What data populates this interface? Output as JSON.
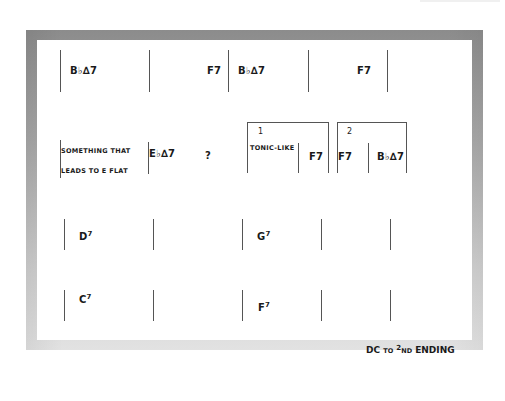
{
  "chart": {
    "rows": [
      {
        "row": 1,
        "measures": [
          {
            "chords": [
              "B♭∆7"
            ]
          },
          {
            "chords": [
              "F7"
            ]
          },
          {
            "chords": [
              "B♭∆7"
            ]
          },
          {
            "chords": [
              "F7"
            ]
          }
        ]
      },
      {
        "row": 2,
        "annotation_line1": "SOMETHING THAT",
        "annotation_line2": "LEADS TO E FLAT",
        "measures": [
          {
            "chords": [
              "E♭∆7"
            ]
          },
          {
            "chords": [
              "?"
            ]
          }
        ],
        "first_ending": {
          "number": "1",
          "label": "TONIC-LIKE",
          "chord": "F7"
        },
        "second_ending": {
          "number": "2",
          "chords": [
            "F7",
            "B♭∆7"
          ]
        }
      },
      {
        "row": 3,
        "measures": [
          {
            "chords": [
              "D7"
            ]
          },
          {
            "chords": []
          },
          {
            "chords": [
              "G7"
            ]
          },
          {
            "chords": []
          }
        ]
      },
      {
        "row": 4,
        "measures": [
          {
            "chords": [
              "C7"
            ]
          },
          {
            "chords": []
          },
          {
            "chords": [
              "F7"
            ]
          },
          {
            "chords": []
          }
        ]
      }
    ],
    "labels": {
      "r1_m1": "B♭∆7",
      "r1_m2": "F7",
      "r1_m3": "B♭∆7",
      "r1_m4": "F7",
      "r2_annot1": "SOMETHING THAT",
      "r2_annot2": "LEADS TO E FLAT",
      "r2_eb": "E♭∆7",
      "r2_q": "?",
      "end1_num": "1",
      "end1_label": "TONIC-LIKE",
      "end1_chord": "F7",
      "end2_num": "2",
      "end2_chord1": "F7",
      "end2_chord2": "B♭∆7",
      "r3_d_root": "D",
      "r3_d_ext": "7",
      "r3_g_root": "G",
      "r3_g_ext": "7",
      "r4_c_root": "C",
      "r4_c_ext": "7",
      "r4_f_root": "F",
      "r4_f_ext": "7"
    },
    "footer": {
      "dc": "DC",
      "to": "TO",
      "ord": "2",
      "nd": "ND",
      "ending": "ENDING"
    }
  }
}
